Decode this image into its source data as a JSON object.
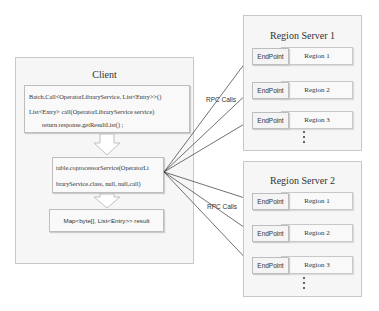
{
  "client": {
    "title": "Client",
    "batch_call": {
      "line1": "Batch.Call<OperatorLibraryService, List<Entry>>()",
      "line2": "List<Entry> call(OperatorLibraryService service)",
      "line3": "return response.getResultList() ;"
    },
    "coprocessor": {
      "line1": "table.coprocessorService(OperatorLi",
      "line2": "braryService.class, null, null,call)"
    },
    "result": "Map<byte[], List<Entry>> result"
  },
  "rpc_label": "RPC Calls",
  "servers": [
    {
      "title": "Region Server 1",
      "regions": [
        {
          "endpoint": "EndPoint",
          "region": "Region 1"
        },
        {
          "endpoint": "EndPoint",
          "region": "Region 2"
        },
        {
          "endpoint": "EndPoint",
          "region": "Region 3"
        }
      ],
      "more": "⋮"
    },
    {
      "title": "Region Server 2",
      "regions": [
        {
          "endpoint": "EndPoint",
          "region": "Region 1"
        },
        {
          "endpoint": "EndPoint",
          "region": "Region 2"
        },
        {
          "endpoint": "EndPoint",
          "region": "Region 3"
        }
      ],
      "more": "⋮"
    }
  ]
}
